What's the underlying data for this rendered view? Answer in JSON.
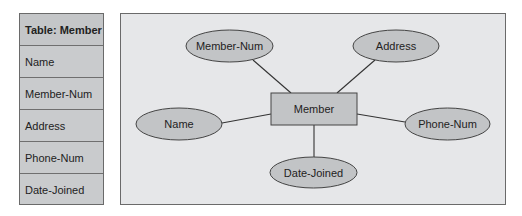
{
  "table": {
    "title": "Table: Member",
    "rows": [
      "Name",
      "Member-Num",
      "Address",
      "Phone-Num",
      "Date-Joined"
    ]
  },
  "diagram": {
    "entity": "Member",
    "attributes": {
      "member_num": "Member-Num",
      "address": "Address",
      "name": "Name",
      "phone_num": "Phone-Num",
      "date_joined": "Date-Joined"
    }
  },
  "colors": {
    "table_fill": "#c9cbcd",
    "panel_fill": "#e6e7e9",
    "shape_fill": "#c2c4c6",
    "stroke": "#333333"
  }
}
